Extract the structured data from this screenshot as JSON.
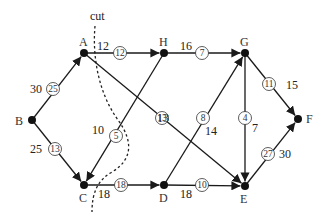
{
  "diagram": {
    "cut_label": "cut",
    "nodes": [
      {
        "id": "A",
        "x": 84,
        "y": 53,
        "lx": 79,
        "ly": 46
      },
      {
        "id": "B",
        "x": 32,
        "y": 120,
        "lx": 15,
        "ly": 125
      },
      {
        "id": "C",
        "x": 84,
        "y": 185,
        "lx": 79,
        "ly": 202
      },
      {
        "id": "D",
        "x": 164,
        "y": 185,
        "lx": 159,
        "ly": 202
      },
      {
        "id": "E",
        "x": 245,
        "y": 186,
        "lx": 240,
        "ly": 203
      },
      {
        "id": "F",
        "x": 298,
        "y": 119,
        "lx": 306,
        "ly": 123
      },
      {
        "id": "G",
        "x": 245,
        "y": 53,
        "lx": 240,
        "ly": 46
      },
      {
        "id": "H",
        "x": 164,
        "y": 53,
        "lx": 159,
        "ly": 46
      }
    ],
    "edges": [
      {
        "from": "B",
        "to": "A",
        "capacity": "30",
        "flow": "25",
        "cap_x": 30,
        "cap_y": 93,
        "flow_x": 53,
        "flow_y": 89
      },
      {
        "from": "B",
        "to": "C",
        "capacity": "25",
        "flow": "13",
        "cap_x": 30,
        "cap_y": 153,
        "flow_x": 55,
        "flow_y": 149
      },
      {
        "from": "A",
        "to": "H",
        "capacity": "12",
        "flow": "12",
        "cap_x": 97,
        "cap_y": 50,
        "flow_x": 120,
        "flow_y": 53
      },
      {
        "from": "H",
        "to": "G",
        "capacity": "16",
        "flow": "7",
        "cap_x": 180,
        "cap_y": 50,
        "flow_x": 202,
        "flow_y": 53
      },
      {
        "from": "H",
        "to": "C",
        "capacity": "10",
        "flow": "5",
        "cap_x": 92,
        "cap_y": 134,
        "flow_x": 116,
        "flow_y": 136
      },
      {
        "from": "A",
        "to": "E",
        "capacity": "13",
        "flow": "13",
        "cap_x": 157,
        "cap_y": 122,
        "flow_x": 162,
        "flow_y": 118
      },
      {
        "from": "C",
        "to": "D",
        "capacity": "18",
        "flow": "18",
        "cap_x": 98,
        "cap_y": 198,
        "flow_x": 121,
        "flow_y": 185
      },
      {
        "from": "D",
        "to": "G",
        "capacity": "14",
        "flow": "8",
        "cap_x": 205,
        "cap_y": 135,
        "flow_x": 203,
        "flow_y": 118
      },
      {
        "from": "D",
        "to": "E",
        "capacity": "18",
        "flow": "10",
        "cap_x": 180,
        "cap_y": 198,
        "flow_x": 202,
        "flow_y": 185
      },
      {
        "from": "G",
        "to": "E",
        "capacity": "7",
        "flow": "4",
        "cap_x": 252,
        "cap_y": 132,
        "flow_x": 245,
        "flow_y": 118
      },
      {
        "from": "G",
        "to": "F",
        "capacity": "15",
        "flow": "11",
        "cap_x": 286,
        "cap_y": 89,
        "flow_x": 269,
        "flow_y": 84
      },
      {
        "from": "E",
        "to": "F",
        "capacity": "30",
        "flow": "27",
        "cap_x": 279,
        "cap_y": 158,
        "flow_x": 268,
        "flow_y": 154
      }
    ]
  }
}
